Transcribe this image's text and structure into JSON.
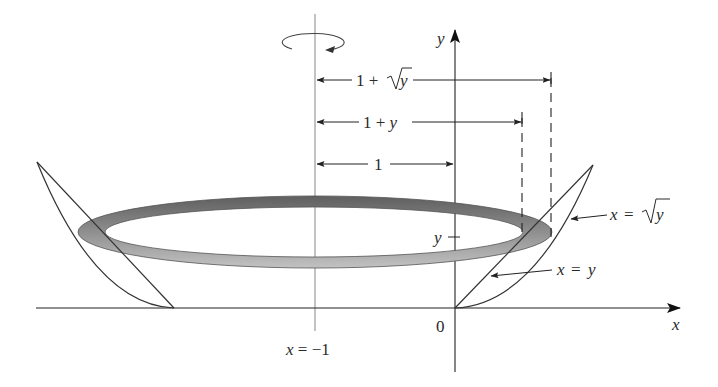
{
  "diagram": {
    "type": "solid-of-revolution",
    "axis_of_rotation": {
      "label": "x = −1",
      "x": -1
    },
    "axes": {
      "x_label": "x",
      "y_label": "y",
      "origin_label": "0"
    },
    "curves": [
      {
        "name": "line",
        "label_left": "x",
        "label_eq": "=",
        "label_right": "y"
      },
      {
        "name": "root",
        "label_left": "x",
        "label_eq": "=",
        "label_right": "y",
        "radical": true
      }
    ],
    "height_tick_label": "y",
    "radii": [
      {
        "name": "outer-radius",
        "label": "1 + ",
        "var": "y",
        "radical": true
      },
      {
        "name": "inner-radius",
        "label": "1 + ",
        "var": "y",
        "radical": false
      },
      {
        "name": "axis-offset",
        "label": "1"
      }
    ],
    "colors": {
      "ring_top": "#6e6e6e",
      "ring_bottom": "#b4b4b4",
      "line": "#333333",
      "axis_of_rotation": "#9a9a9a"
    }
  }
}
